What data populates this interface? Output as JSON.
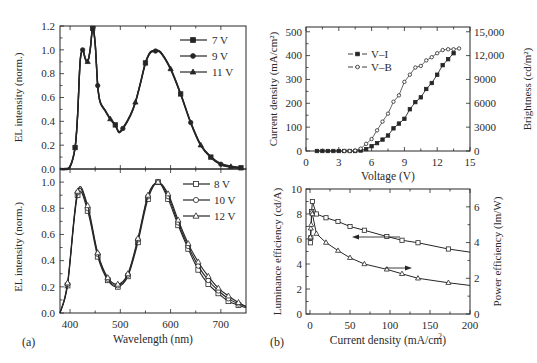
{
  "panels": {
    "a_label": "(a)",
    "b_label": "(b)"
  },
  "chart_data": [
    {
      "id": "a-top",
      "type": "line",
      "title": "",
      "xlabel": "Wavelength (nm)",
      "ylabel": "EL intensity (norm.)",
      "xlim": [
        380,
        750
      ],
      "ylim": [
        0.0,
        1.2
      ],
      "yticks": [
        "0.0",
        "0.2",
        "0.4",
        "0.6",
        "0.8",
        "1.0",
        "1.2"
      ],
      "legend_position": "upper right",
      "series": [
        {
          "name": "7 V",
          "marker": "filled-square"
        },
        {
          "name": "9 V",
          "marker": "filled-circle"
        },
        {
          "name": "11 V",
          "marker": "filled-triangle"
        }
      ],
      "x": [
        380,
        390,
        400,
        410,
        415,
        420,
        425,
        430,
        435,
        440,
        445,
        450,
        455,
        460,
        470,
        480,
        490,
        497,
        505,
        520,
        530,
        540,
        550,
        560,
        570,
        580,
        600,
        620,
        640,
        660,
        680,
        700,
        720,
        740
      ],
      "values": [
        0.0,
        0.0,
        0.02,
        0.18,
        0.45,
        0.9,
        1.0,
        0.93,
        0.9,
        1.0,
        1.18,
        1.05,
        0.7,
        0.56,
        0.49,
        0.42,
        0.37,
        0.31,
        0.34,
        0.45,
        0.56,
        0.72,
        0.89,
        0.98,
        0.99,
        0.98,
        0.84,
        0.63,
        0.39,
        0.2,
        0.1,
        0.04,
        0.02,
        0.01
      ]
    },
    {
      "id": "a-bottom",
      "type": "line",
      "title": "",
      "xlabel": "Wavelength (nm)",
      "ylabel": "EL intensity (norm.)",
      "xlim": [
        380,
        750
      ],
      "ylim": [
        0.0,
        1.1
      ],
      "xticks": [
        "400",
        "500",
        "600",
        "700"
      ],
      "yticks": [
        "0.0",
        "0.2",
        "0.4",
        "0.6",
        "0.8",
        "1.0"
      ],
      "legend_position": "upper right",
      "x": [
        380,
        395,
        415,
        435,
        455,
        475,
        495,
        515,
        535,
        555,
        575,
        595,
        615,
        635,
        655,
        675,
        695,
        715,
        735,
        750
      ],
      "series": [
        {
          "name": "8 V",
          "marker": "open-square",
          "values": [
            0.0,
            0.21,
            0.9,
            0.78,
            0.43,
            0.25,
            0.2,
            0.28,
            0.54,
            0.87,
            1.0,
            0.87,
            0.67,
            0.49,
            0.33,
            0.22,
            0.15,
            0.09,
            0.06,
            0.04
          ]
        },
        {
          "name": "10 V",
          "marker": "open-circle",
          "values": [
            0.0,
            0.22,
            0.92,
            0.8,
            0.45,
            0.26,
            0.21,
            0.29,
            0.56,
            0.89,
            1.0,
            0.89,
            0.69,
            0.51,
            0.36,
            0.25,
            0.17,
            0.11,
            0.07,
            0.05
          ]
        },
        {
          "name": "12 V",
          "marker": "open-triangle",
          "values": [
            0.0,
            0.23,
            0.93,
            0.82,
            0.46,
            0.27,
            0.22,
            0.3,
            0.57,
            0.9,
            1.0,
            0.91,
            0.71,
            0.53,
            0.39,
            0.28,
            0.19,
            0.13,
            0.08,
            0.05
          ]
        }
      ]
    },
    {
      "id": "b-top",
      "type": "line",
      "title": "",
      "xlabel": "Voltage (V)",
      "ylabel": "Current density (mA/cm²)",
      "ylabel_right": "Brightness (cd/m²)",
      "xlim": [
        0,
        15
      ],
      "ylim": [
        0,
        520
      ],
      "ylim_right": [
        0,
        15600
      ],
      "xticks": [
        "0",
        "3",
        "6",
        "9",
        "12",
        "15"
      ],
      "yticks": [
        "0",
        "100",
        "200",
        "300",
        "400",
        "500"
      ],
      "yticks_right": [
        "0",
        "3000",
        "6000",
        "9000",
        "12,000",
        "15,000"
      ],
      "legend_position": "upper left",
      "series": [
        {
          "name": "V–I",
          "axis": "left",
          "marker": "filled-square",
          "x": [
            1,
            1.5,
            2,
            2.5,
            3,
            3.5,
            4,
            4.5,
            5,
            5.5,
            6,
            6.5,
            7,
            7.5,
            8,
            8.5,
            9,
            9.5,
            10,
            10.5,
            11,
            11.5,
            12,
            12.5,
            13,
            13.5
          ],
          "values": [
            0,
            0,
            0,
            0,
            0,
            0,
            0,
            0,
            2,
            8,
            20,
            33,
            48,
            65,
            95,
            115,
            135,
            175,
            205,
            225,
            260,
            285,
            320,
            360,
            385,
            410
          ]
        },
        {
          "name": "V–B",
          "axis": "right",
          "marker": "open-circle",
          "x": [
            3.5,
            4,
            4.5,
            5,
            5.5,
            6,
            6.5,
            7,
            7.5,
            8,
            8.5,
            9,
            9.5,
            10,
            10.5,
            11,
            11.5,
            12,
            12.5,
            13,
            13.5,
            14
          ],
          "values": [
            0,
            0,
            50,
            300,
            900,
            1500,
            2600,
            3700,
            4700,
            6200,
            7000,
            8700,
            9600,
            10500,
            10700,
            11400,
            11800,
            12300,
            12700,
            12800,
            12800,
            12900
          ]
        }
      ]
    },
    {
      "id": "b-bottom",
      "type": "line",
      "title": "",
      "xlabel": "Current density (mA/cm²)",
      "ylabel": "Luminance efficiency (cd/A)",
      "ylabel_right": "Power efficiency (lm/W)",
      "xlim": [
        -5,
        200
      ],
      "ylim": [
        0,
        10
      ],
      "ylim_right": [
        0,
        7
      ],
      "xticks": [
        "0",
        "50",
        "100",
        "150",
        "200"
      ],
      "yticks": [
        "0",
        "2",
        "4",
        "6",
        "8",
        "10"
      ],
      "yticks_right": [
        "0",
        "2",
        "4",
        "6"
      ],
      "annotations": [
        "left-pointing arrow near luminance curve",
        "right-pointing arrow near power-efficiency curve"
      ],
      "series": [
        {
          "name": "Luminance efficiency",
          "axis": "left",
          "marker": "open-square",
          "x": [
            0.5,
            1,
            2,
            3,
            8,
            20,
            35,
            50,
            68,
            96,
            115,
            135,
            173,
            200
          ],
          "values": [
            5.7,
            6.1,
            8.2,
            9.0,
            8.0,
            7.7,
            7.4,
            7.0,
            6.7,
            6.2,
            5.9,
            5.7,
            5.2,
            4.95
          ]
        },
        {
          "name": "Power efficiency",
          "axis": "right",
          "marker": "open-triangle",
          "x": [
            0.5,
            1,
            1.5,
            2,
            3,
            8,
            20,
            35,
            50,
            68,
            96,
            115,
            135,
            173,
            200
          ],
          "values": [
            4.3,
            4.8,
            5.0,
            5.7,
            5.6,
            4.5,
            4.0,
            3.55,
            3.15,
            2.8,
            2.5,
            2.25,
            2.0,
            1.75,
            1.6
          ]
        }
      ]
    }
  ]
}
